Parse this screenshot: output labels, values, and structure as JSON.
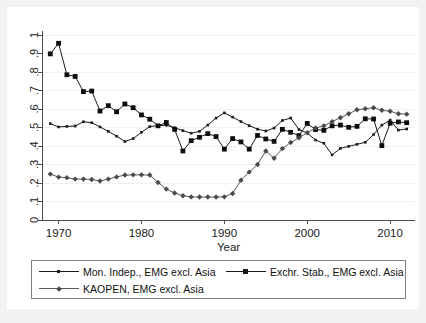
{
  "figure": {
    "background_color": "#f2f2f2",
    "plot_background_color": "#ffffff",
    "axis_color": "#4d4d4d",
    "gridline_color": "#f0f0f2"
  },
  "axes": {
    "xlabel": "Year",
    "ylabel": "",
    "x_ticks": [
      "1970",
      "1980",
      "1990",
      "2000",
      "2010"
    ],
    "y_ticks": [
      "0",
      ".1",
      ".2",
      ".3",
      ".4",
      ".5",
      ".6",
      ".7",
      ".8",
      ".9",
      "1"
    ]
  },
  "legend": {
    "items": [
      {
        "label": "Mon. Indep., EMG excl. Asia",
        "marker": "small-square",
        "color": "#1a1a1a"
      },
      {
        "label": "Exchr. Stab., EMG excl. Asia",
        "marker": "filled-square",
        "color": "#0d0d0d"
      },
      {
        "label": "KAOPEN, EMG excl. Asia",
        "marker": "diamond",
        "color": "#4a4a4a"
      }
    ]
  },
  "chart_data": {
    "type": "line",
    "title": "",
    "xlabel": "Year",
    "ylabel": "",
    "xlim": [
      1968.0,
      2013.0
    ],
    "ylim": [
      0,
      1
    ],
    "grid": true,
    "legend_position": "bottom",
    "x": [
      1969,
      1970,
      1971,
      1972,
      1973,
      1974,
      1975,
      1976,
      1977,
      1978,
      1979,
      1980,
      1981,
      1982,
      1983,
      1984,
      1985,
      1986,
      1987,
      1988,
      1989,
      1990,
      1991,
      1992,
      1993,
      1994,
      1995,
      1996,
      1997,
      1998,
      1999,
      2000,
      2001,
      2002,
      2003,
      2004,
      2005,
      2006,
      2007,
      2008,
      2009,
      2010,
      2011,
      2012
    ],
    "series": [
      {
        "name": "Mon. Indep., EMG excl. Asia",
        "marker": "small-square",
        "color": "#1a1a1a",
        "values": [
          0.521,
          0.503,
          0.506,
          0.508,
          0.531,
          0.526,
          0.503,
          0.479,
          0.453,
          0.424,
          0.44,
          0.474,
          0.505,
          0.51,
          0.512,
          0.499,
          0.483,
          0.469,
          0.479,
          0.513,
          0.551,
          0.579,
          0.556,
          0.532,
          0.51,
          0.491,
          0.481,
          0.497,
          0.538,
          0.551,
          0.489,
          0.47,
          0.432,
          0.415,
          0.352,
          0.387,
          0.398,
          0.409,
          0.42,
          0.462,
          0.513,
          0.54,
          0.486,
          0.492
        ]
      },
      {
        "name": "Exchr. Stab., EMG excl. Asia",
        "marker": "filled-square",
        "color": "#0d0d0d",
        "values": [
          0.898,
          0.955,
          0.785,
          0.776,
          0.694,
          0.697,
          0.589,
          0.618,
          0.585,
          0.627,
          0.607,
          0.568,
          0.545,
          0.509,
          0.527,
          0.49,
          0.373,
          0.429,
          0.447,
          0.467,
          0.451,
          0.383,
          0.44,
          0.422,
          0.383,
          0.457,
          0.438,
          0.425,
          0.49,
          0.474,
          0.456,
          0.522,
          0.489,
          0.485,
          0.509,
          0.513,
          0.501,
          0.506,
          0.547,
          0.546,
          0.402,
          0.523,
          0.53,
          0.526
        ]
      },
      {
        "name": "KAOPEN, EMG excl. Asia",
        "marker": "diamond",
        "color": "#4a4a4a",
        "values": [
          0.248,
          0.232,
          0.229,
          0.221,
          0.221,
          0.219,
          0.211,
          0.221,
          0.233,
          0.243,
          0.244,
          0.244,
          0.243,
          0.203,
          0.167,
          0.146,
          0.131,
          0.125,
          0.124,
          0.124,
          0.124,
          0.125,
          0.143,
          0.215,
          0.259,
          0.3,
          0.373,
          0.334,
          0.386,
          0.419,
          0.444,
          0.472,
          0.497,
          0.509,
          0.532,
          0.553,
          0.574,
          0.596,
          0.601,
          0.607,
          0.593,
          0.588,
          0.574,
          0.572
        ]
      }
    ]
  }
}
